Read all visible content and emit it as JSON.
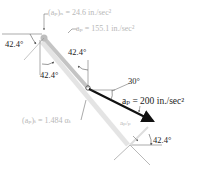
{
  "diagram": {
    "labels": {
      "ap_n": "(aₚ)ₙ = 24.6 in./sec²",
      "ap": "aₚ = 155.1 in./sec²",
      "ap_t": "(aₚ)ₜ = 1.484 αₜ",
      "aP": "aₚ = 200 in./sec²",
      "aPp": "aₚ/ₚ",
      "angle_top_left": "42.4°",
      "angle_mid_upper": "42.4°",
      "angle_mid_lower": "42.4°",
      "angle_bottom": "42.4°",
      "angle_30": "30°"
    },
    "colors": {
      "primary_arrow": "#111111",
      "link": "#c8c8c8",
      "faint_text": "#b8b8b8",
      "dim_line": "#555555"
    }
  }
}
